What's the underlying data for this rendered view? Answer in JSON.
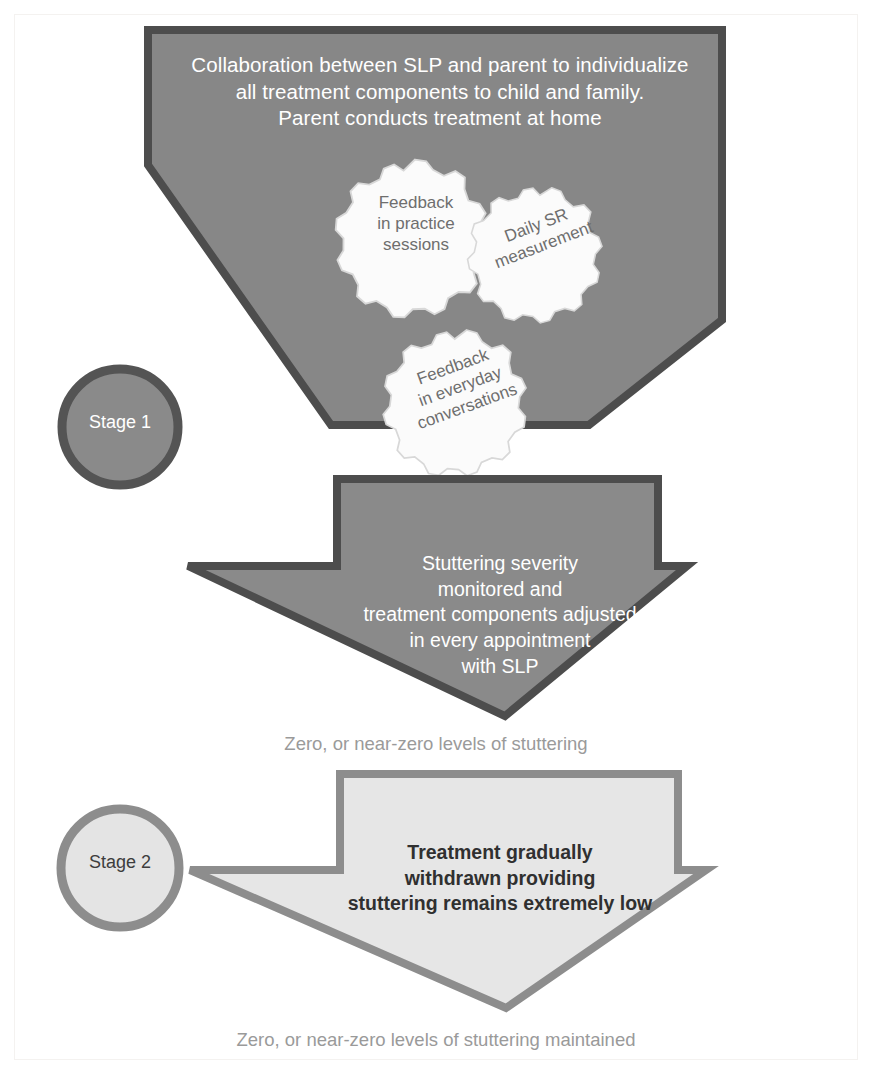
{
  "diagram": {
    "title_text": "Collaboration between SLP and parent to individualize\nall treatment components to child and family.\nParent conducts treatment at home",
    "funnel": {
      "label": "Collaboration between SLP and parent to individualize\nall treatment components to child and family.\nParent conducts treatment at home",
      "fill": "#878787",
      "border": "#4d4d4d"
    },
    "gears": [
      {
        "name": "feedback-practice-sessions",
        "label": "Feedback\nin practice\nsessions",
        "fill": "#fbfbfb",
        "text_color": "#6e6e6e",
        "rotation_deg": 0
      },
      {
        "name": "daily-sr-measurement",
        "label": "Daily SR\nmeasurement",
        "fill": "#fbfbfb",
        "text_color": "#6e6e6e",
        "rotation_deg": -21
      },
      {
        "name": "feedback-everyday-conversations",
        "label": "Feedback\nin everyday\nconversations",
        "fill": "#fbfbfb",
        "text_color": "#6e6e6e",
        "rotation_deg": -20
      }
    ],
    "stages": [
      {
        "name": "stage-1",
        "label": "Stage 1",
        "fill": "#8a8a8a",
        "border": "#545454",
        "text_color": "#ffffff"
      },
      {
        "name": "stage-2",
        "label": "Stage 2",
        "fill": "#e4e4e4",
        "border": "#8d8d8d",
        "text_color": "#3d3d3d"
      }
    ],
    "arrows": [
      {
        "name": "stage-1-arrow",
        "label": "Stuttering severity\nmonitored and\ntreatment components adjusted\nin every appointment\nwith SLP",
        "fill": "#8a8a8a",
        "border": "#4d4d4d",
        "text_color": "#ffffff"
      },
      {
        "name": "stage-2-arrow",
        "label": "Treatment gradually\nwithdrawn providing\nstuttering remains extremely low",
        "fill": "#e6e6e6",
        "border": "#8d8d8d",
        "text_color": "#303030"
      }
    ],
    "captions": [
      {
        "name": "caption-zero-stuttering",
        "text": "Zero, or near-zero levels of stuttering",
        "color": "#9a9a9a"
      },
      {
        "name": "caption-zero-stuttering-maintained",
        "text": "Zero, or near-zero levels of stuttering maintained",
        "color": "#9a9a9a"
      }
    ]
  }
}
